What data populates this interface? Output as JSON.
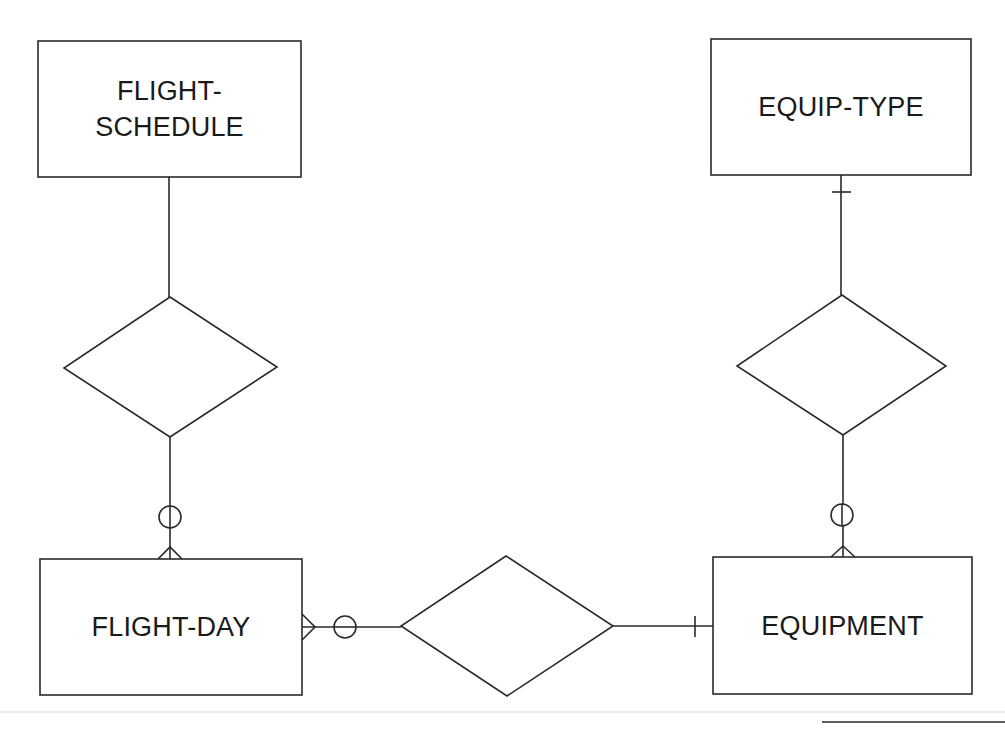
{
  "diagram": {
    "type": "entity-relationship",
    "colors": {
      "stroke": "#2a2a2a",
      "background": "#ffffff",
      "text": "#1a1a1a",
      "scan_line": "#e6e6e6"
    },
    "entities": [
      {
        "id": "flight_schedule",
        "label_line1": "FLIGHT-",
        "label_line2": "SCHEDULE"
      },
      {
        "id": "equip_type",
        "label": "EQUIP-TYPE"
      },
      {
        "id": "flight_day",
        "label": "FLIGHT-DAY"
      },
      {
        "id": "equipment",
        "label": "EQUIPMENT"
      }
    ],
    "relationships": [
      {
        "id": "rel_schedule_day",
        "from": "FLIGHT-SCHEDULE",
        "to": "FLIGHT-DAY",
        "from_cardinality": "unspecified",
        "to_cardinality": "zero-or-many"
      },
      {
        "id": "rel_type_equipment",
        "from": "EQUIP-TYPE",
        "to": "EQUIPMENT",
        "from_cardinality": "one",
        "to_cardinality": "zero-or-many"
      },
      {
        "id": "rel_day_equipment",
        "from": "FLIGHT-DAY",
        "to": "EQUIPMENT",
        "from_cardinality": "zero-or-many",
        "to_cardinality": "one"
      }
    ]
  }
}
